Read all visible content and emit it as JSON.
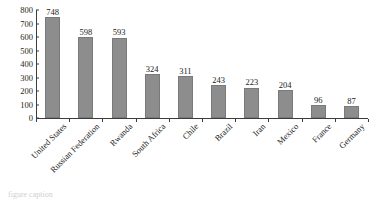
{
  "chart_data": {
    "type": "bar",
    "title": "",
    "subtitle": "",
    "xlabel": "",
    "ylabel": "",
    "ylim": [
      0,
      800
    ],
    "y_ticks": [
      0,
      100,
      200,
      300,
      400,
      500,
      600,
      700,
      800
    ],
    "grid": false,
    "legend": null,
    "bar_color": "#8d8d8d",
    "axis_color": "#3c3c3c",
    "label_rotation_deg": -45,
    "value_labels_shown": true,
    "categories": [
      "United States",
      "Russian Federation",
      "Rwanda",
      "South Africa",
      "Chile",
      "Brazil",
      "Iran",
      "Mexico",
      "France",
      "Germany"
    ],
    "values": [
      748,
      598,
      593,
      324,
      311,
      243,
      223,
      204,
      96,
      87
    ]
  },
  "caption": {
    "text": "figure caption"
  }
}
